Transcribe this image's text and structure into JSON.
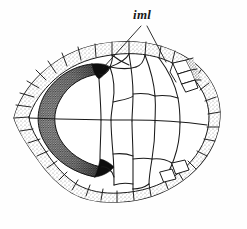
{
  "figure": {
    "kind": "anatomical-line-drawing",
    "background_color": "#fefefe",
    "ink_color": "#1a1a1a",
    "stipple_color": "#6b6b6b",
    "dark_fill_color": "#101010",
    "labels": [
      {
        "id": "iml",
        "text": "iml",
        "style": "italic",
        "x": 133,
        "y": 8,
        "leader_lines": 2
      }
    ],
    "annotations": {
      "leader_line_1_from": "141,26",
      "leader_line_1_to": "103,68",
      "leader_line_2_from": "147,26",
      "leader_line_2_to": "166,62"
    },
    "regions": {
      "shaded_horseshoe": "anterior-left dark stippled U-shaped band",
      "marginal_scutes": "stippled peripheral ring",
      "midline": "horizontal sulcus across center"
    }
  }
}
